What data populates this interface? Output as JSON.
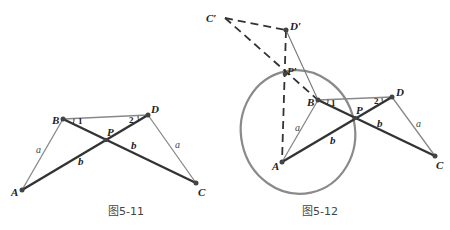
{
  "figures": [
    {
      "caption": "图5-11",
      "points": {
        "A": "A",
        "B": "B",
        "C": "C",
        "D": "D",
        "P": "P"
      },
      "segment_labels": {
        "AB": "a",
        "CD": "a",
        "AP": "b",
        "PC": "b"
      },
      "angles": {
        "1": "1",
        "2": "2"
      }
    },
    {
      "caption": "图5-12",
      "points": {
        "A": "A",
        "B": "B",
        "C": "C",
        "D": "D",
        "P": "P",
        "C_prime": "C′",
        "D_prime": "D′",
        "P_prime": "P′"
      },
      "segment_labels": {
        "AB": "a",
        "CD": "a",
        "AP": "b",
        "PC": "b"
      },
      "angles": {
        "1": "1",
        "2": "2"
      }
    }
  ],
  "colors": {
    "thick": "#333333",
    "thin": "#888888",
    "circle": "#8a8a8a",
    "dashed": "#333333"
  }
}
